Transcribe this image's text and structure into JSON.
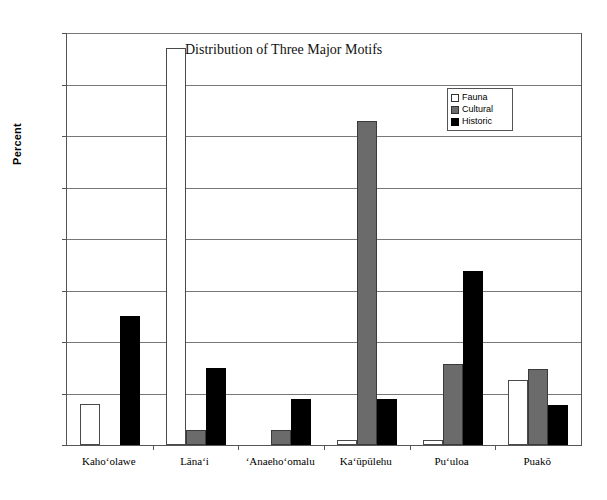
{
  "chart_data": {
    "type": "bar",
    "title": "Distribution of Three Major Motifs",
    "xlabel": "",
    "ylabel": "Percent",
    "ylim": [
      0,
      80
    ],
    "yticks": [
      0,
      10,
      20,
      30,
      40,
      50,
      60,
      70,
      80
    ],
    "grid": true,
    "legend_position": "top-right-inside",
    "categories": [
      "Kahoʻolawe",
      "Lānaʻi",
      "ʻAnaehoʻomalu",
      "Kaʻūpūlehu",
      "Puʻuloa",
      "Puakō"
    ],
    "series": [
      {
        "name": "Fauna",
        "color": "#ffffff",
        "values": [
          8.0,
          77.0,
          0.0,
          1.0,
          1.0,
          12.7
        ]
      },
      {
        "name": "Cultural",
        "color": "#6b6b6b",
        "values": [
          0.0,
          3.0,
          3.0,
          63.0,
          15.8,
          14.8
        ]
      },
      {
        "name": "Historic",
        "color": "#000000",
        "values": [
          25.0,
          15.0,
          9.0,
          9.0,
          33.7,
          7.8
        ]
      }
    ]
  },
  "axes": {
    "y_title": "Percent"
  }
}
